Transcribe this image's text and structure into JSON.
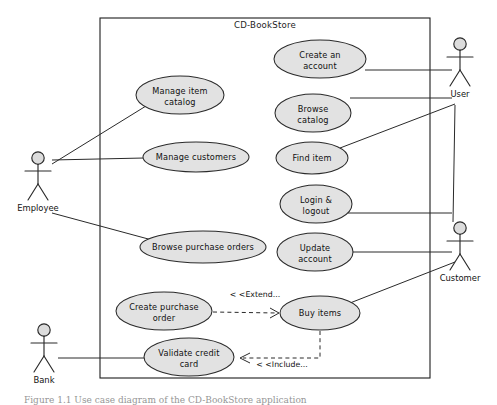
{
  "figure": {
    "caption": "Figure 1.1  Use case diagram of the CD-BookStore application"
  },
  "system": {
    "boundary_title": "CD-BookStore",
    "boundary": {
      "x": 100,
      "y": 18,
      "width": 330,
      "height": 360
    }
  },
  "colors": {
    "usecase_fill": "#e2e2e2",
    "stroke": "#2a2a2a",
    "actor_head_fill": "#dcdcdc",
    "background": "#ffffff"
  },
  "usecases": [
    {
      "id": "create-an-account",
      "label_line1": "Create an",
      "label_line2": "account",
      "cx": 320,
      "cy": 59,
      "rx": 46,
      "ry": 19
    },
    {
      "id": "manage-item-catalog",
      "label_line1": "Manage item",
      "label_line2": "catalog",
      "cx": 180,
      "cy": 95,
      "rx": 44,
      "ry": 19
    },
    {
      "id": "browse-catalog",
      "label_line1": "Browse",
      "label_line2": "catalog",
      "cx": 313,
      "cy": 113,
      "rx": 38,
      "ry": 19
    },
    {
      "id": "manage-customers",
      "label_line1": "Manage customers",
      "label_line2": "",
      "cx": 196,
      "cy": 157,
      "rx": 53,
      "ry": 15
    },
    {
      "id": "find-item",
      "label_line1": "Find item",
      "label_line2": "",
      "cx": 312,
      "cy": 158,
      "rx": 36,
      "ry": 16
    },
    {
      "id": "login-logout",
      "label_line1": "Login &",
      "label_line2": "logout",
      "cx": 316,
      "cy": 204,
      "rx": 36,
      "ry": 19
    },
    {
      "id": "browse-purchase-orders",
      "label_line1": "Browse purchase orders",
      "label_line2": "",
      "cx": 203,
      "cy": 247,
      "rx": 63,
      "ry": 16
    },
    {
      "id": "update-account",
      "label_line1": "Update",
      "label_line2": "account",
      "cx": 315,
      "cy": 252,
      "rx": 38,
      "ry": 19
    },
    {
      "id": "create-purchase-order",
      "label_line1": "Create purchase",
      "label_line2": "order",
      "cx": 164,
      "cy": 311,
      "rx": 48,
      "ry": 19
    },
    {
      "id": "buy-items",
      "label_line1": "Buy items",
      "label_line2": "",
      "cx": 320,
      "cy": 313,
      "rx": 40,
      "ry": 17
    },
    {
      "id": "validate-credit-card",
      "label_line1": "Validate credit",
      "label_line2": "card",
      "cx": 189,
      "cy": 357,
      "rx": 45,
      "ry": 19
    }
  ],
  "actors": [
    {
      "id": "employee",
      "label": "Employee",
      "x": 38,
      "y": 158
    },
    {
      "id": "bank",
      "label": "Bank",
      "x": 44,
      "y": 330
    },
    {
      "id": "user",
      "label": "User",
      "x": 460,
      "y": 44
    },
    {
      "id": "customer",
      "label": "Customer",
      "x": 460,
      "y": 228
    }
  ],
  "associations": [
    {
      "id": "employee-manage-item-catalog",
      "from": "employee",
      "to": "manage-item-catalog",
      "x1": 52,
      "y1": 164,
      "x2": 146,
      "y2": 106
    },
    {
      "id": "employee-manage-customers",
      "from": "employee",
      "to": "manage-customers",
      "x1": 52,
      "y1": 160,
      "x2": 144,
      "y2": 158
    },
    {
      "id": "employee-browse-purchase-orders",
      "from": "employee",
      "to": "browse-purchase-orders",
      "x1": 52,
      "y1": 213,
      "x2": 152,
      "y2": 240
    },
    {
      "id": "bank-validate-credit-card",
      "from": "bank",
      "to": "validate-credit-card",
      "x1": 58,
      "y1": 358,
      "x2": 145,
      "y2": 358
    },
    {
      "id": "user-create-an-account",
      "from": "user",
      "to": "create-an-account",
      "x1": 365,
      "y1": 70,
      "x2": 452,
      "y2": 70
    },
    {
      "id": "user-browse-catalog",
      "from": "user",
      "to": "browse-catalog",
      "x1": 350,
      "y1": 98,
      "x2": 452,
      "y2": 98
    },
    {
      "id": "user-find-item",
      "from": "user",
      "to": "find-item",
      "x1": 340,
      "y1": 148,
      "x2": 455,
      "y2": 104
    },
    {
      "id": "customer-login-logout",
      "from": "customer",
      "to": "login-logout",
      "x1": 348,
      "y1": 213,
      "x2": 452,
      "y2": 213
    },
    {
      "id": "customer-update-account",
      "from": "customer",
      "to": "update-account",
      "x1": 352,
      "y1": 252,
      "x2": 452,
      "y2": 252
    },
    {
      "id": "customer-buy-items",
      "from": "customer",
      "to": "buy-items",
      "x1": 350,
      "y1": 303,
      "x2": 455,
      "y2": 262
    },
    {
      "id": "user-to-customer-region",
      "from": "user",
      "to": "customer",
      "x1": 455,
      "y1": 105,
      "x2": 453,
      "y2": 222
    }
  ],
  "relationships": [
    {
      "id": "extend-create-purchase-order-buy-items",
      "label": "< <Extend...",
      "kind": "extend",
      "label_x": 255,
      "label_y": 297,
      "path": "M 213 312 L 277 313",
      "arrow": "M 270 308 L 279 313 L 270 318"
    },
    {
      "id": "include-buy-items-validate-credit-card",
      "label": "< <Include...",
      "kind": "include",
      "label_x": 282,
      "label_y": 367,
      "path": "M 320 331 L 320 358 L 243 358",
      "arrow": "M 250 353 L 240 358 L 250 363"
    }
  ]
}
